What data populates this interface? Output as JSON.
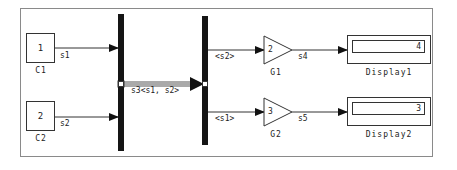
{
  "diagram": {
    "blocks": {
      "c1": {
        "value": "1",
        "name": "C1"
      },
      "c2": {
        "value": "2",
        "name": "C2"
      },
      "g1": {
        "gain": "2",
        "name": "G1"
      },
      "g2": {
        "gain": "3",
        "name": "G2"
      },
      "display1": {
        "value": "4",
        "name": "Display1"
      },
      "display2": {
        "value": "3",
        "name": "Display2"
      },
      "mux": {
        "name": "Mux"
      },
      "demux": {
        "name": "Demux"
      }
    },
    "signals": {
      "s1": "s1",
      "s2": "s2",
      "s3": "s3<s1, s2>",
      "demux_out1": "<s2>",
      "demux_out2": "<s1>",
      "s4": "s4",
      "s5": "s5"
    },
    "colors": {
      "line": "#333333",
      "bar": "#151515",
      "frame": "#8a8a8a"
    }
  }
}
